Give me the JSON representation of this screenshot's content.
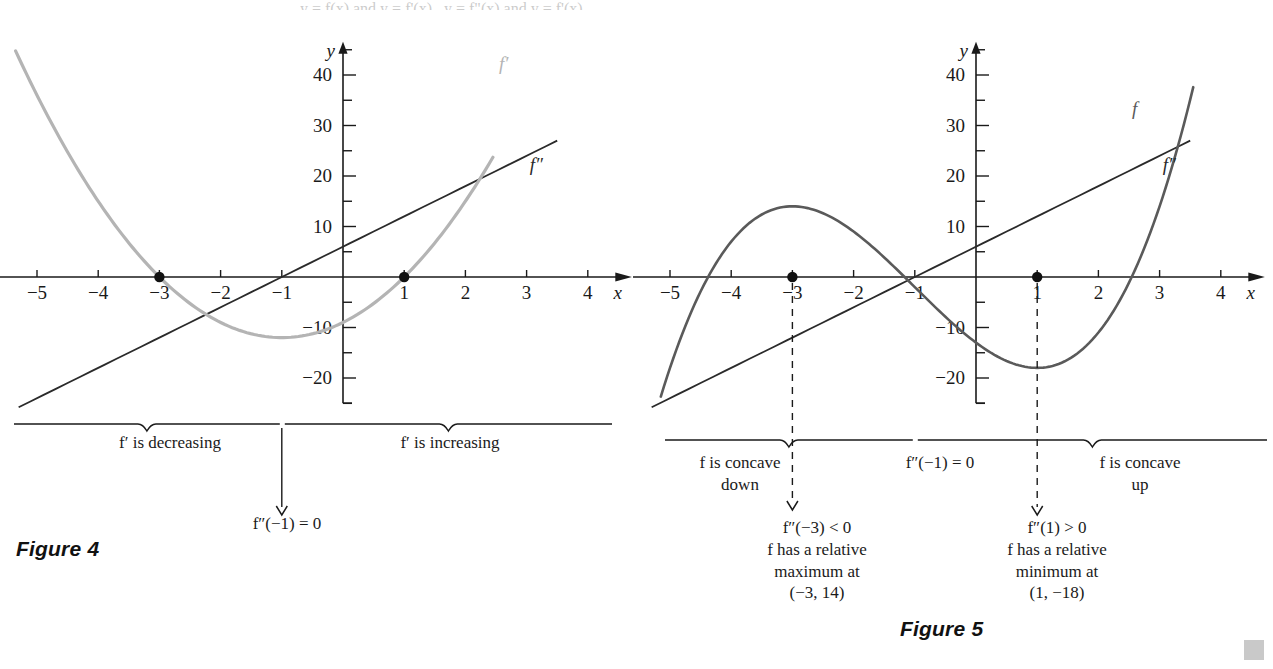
{
  "page": {
    "top_cut_text": "y = f(x)   and   y = f'(x)   ,   y = f\"(x)   and   y = f'(x)",
    "corner_mark": "gray-square"
  },
  "figures": [
    {
      "id": "figure-4",
      "caption": "Figure 4",
      "axis": {
        "x_label": "x",
        "y_label": "y",
        "x_ticks": [
          -5,
          -4,
          -3,
          -2,
          -1,
          1,
          2,
          3,
          4
        ],
        "x_tick_labels": [
          "−5",
          "−4",
          "−3",
          "−2",
          "−1",
          "1",
          "2",
          "3",
          "4"
        ],
        "y_tick_labels": [
          "40",
          "30",
          "20",
          "10",
          "−10",
          "−20"
        ],
        "y_ticks": [
          40,
          30,
          20,
          10,
          -10,
          -20
        ],
        "y_minor_step": 5,
        "xlim": [
          -5.6,
          4.6
        ],
        "ylim": [
          -25,
          46
        ]
      },
      "curves": [
        {
          "name": "f-prime-curve",
          "label": "f′",
          "color": "#b4b4b4",
          "label_x": 2.55,
          "label_y": 41
        },
        {
          "name": "f-double-prime-line",
          "label": "f″",
          "color": "#2a2a2a",
          "label_x": 3.05,
          "label_y": 21
        }
      ],
      "points": [
        {
          "name": "root-point-left",
          "x": -3,
          "y": 0
        },
        {
          "name": "root-point-right",
          "x": 1,
          "y": 0
        }
      ],
      "braces": [
        {
          "name": "brace-decreasing",
          "label": "f′ is decreasing"
        },
        {
          "name": "brace-increasing",
          "label": "f′ is increasing"
        }
      ],
      "callout": {
        "name": "inflection-callout",
        "text": "f″(−1) = 0"
      }
    },
    {
      "id": "figure-5",
      "caption": "Figure 5",
      "axis": {
        "x_label": "x",
        "y_label": "y",
        "x_ticks": [
          -5,
          -4,
          -3,
          -2,
          -1,
          1,
          2,
          3,
          4
        ],
        "x_tick_labels": [
          "−5",
          "−4",
          "−3",
          "−2",
          "−1",
          "1",
          "2",
          "3",
          "4"
        ],
        "y_tick_labels": [
          "40",
          "30",
          "20",
          "10",
          "−10",
          "−20"
        ],
        "y_ticks": [
          40,
          30,
          20,
          10,
          -10,
          -20
        ],
        "y_minor_step": 5,
        "xlim": [
          -5.6,
          4.6
        ],
        "ylim": [
          -25,
          46
        ]
      },
      "curves": [
        {
          "name": "f-curve",
          "label": "f",
          "color": "#5a5a5a",
          "label_x": 2.55,
          "label_y": 32
        },
        {
          "name": "f-double-prime-line",
          "label": "f″",
          "color": "#2a2a2a",
          "label_x": 3.05,
          "label_y": 21
        }
      ],
      "points": [
        {
          "name": "relative-max-marker",
          "x": -3,
          "y": 0
        },
        {
          "name": "relative-min-marker",
          "x": 1,
          "y": 0
        }
      ],
      "braces": [
        {
          "name": "brace-concave-down",
          "label": "f is concave\ndown"
        },
        {
          "name": "brace-concave-up",
          "label": "f is concave\nup"
        }
      ],
      "center_note": {
        "name": "inflection-note",
        "text": "f″(−1) = 0"
      },
      "callouts": [
        {
          "name": "callout-relative-maximum",
          "lines": [
            "f″(−3) < 0",
            "f has a relative",
            "maximum at",
            "(−3, 14)"
          ]
        },
        {
          "name": "callout-relative-minimum",
          "lines": [
            "f″(1) > 0",
            "f has a relative",
            "minimum at",
            "(1, −18)"
          ]
        }
      ]
    }
  ],
  "chart_data": [
    {
      "type": "line",
      "title": "Figure 4",
      "xlabel": "x",
      "ylabel": "y",
      "xlim": [
        -5.6,
        4.6
      ],
      "ylim": [
        -25,
        46
      ],
      "grid": false,
      "legend": "inline-labels",
      "series": [
        {
          "name": "f'",
          "expression": "3x^2 + 6x - 9",
          "color": "#b4b4b4",
          "domain": [
            -5.35,
            2.45
          ],
          "key_points": {
            "roots": [
              -3,
              1
            ],
            "vertex": [
              -1,
              -12
            ]
          },
          "x": [
            -5,
            -4,
            -3,
            -2,
            -1,
            0,
            1,
            2
          ],
          "y": [
            36,
            15,
            0,
            -9,
            -12,
            -9,
            0,
            15
          ]
        },
        {
          "name": "f\"",
          "expression": "6x + 6",
          "color": "#2a2a2a",
          "domain": [
            -5.3,
            3.6
          ],
          "key_points": {
            "roots": [
              -1
            ]
          },
          "x": [
            -5,
            -4,
            -3,
            -2,
            -1,
            0,
            1,
            2,
            3
          ],
          "y": [
            -24,
            -18,
            -12,
            -6,
            0,
            6,
            12,
            18,
            24
          ]
        }
      ],
      "annotations": [
        "f' is decreasing",
        "f' is increasing",
        "f\"(-1) = 0"
      ]
    },
    {
      "type": "line",
      "title": "Figure 5",
      "xlabel": "x",
      "ylabel": "y",
      "xlim": [
        -5.6,
        4.6
      ],
      "ylim": [
        -25,
        46
      ],
      "grid": false,
      "legend": "inline-labels",
      "series": [
        {
          "name": "f",
          "expression": "x^3 + 3x^2 - 9x - 13",
          "color": "#5a5a5a",
          "domain": [
            -5.15,
            3.55
          ],
          "key_points": {
            "relative_maximum": [
              -3,
              14
            ],
            "relative_minimum": [
              1,
              -18
            ],
            "inflection": [
              -1,
              -2
            ]
          },
          "x": [
            -5,
            -4,
            -3,
            -2,
            -1,
            0,
            1,
            2,
            3
          ],
          "y": [
            -18,
            7,
            14,
            9,
            -2,
            -13,
            -18,
            -11,
            14
          ]
        },
        {
          "name": "f\"",
          "expression": "6x + 6",
          "color": "#2a2a2a",
          "domain": [
            -5.3,
            3.6
          ],
          "key_points": {
            "roots": [
              -1
            ]
          },
          "x": [
            -5,
            -4,
            -3,
            -2,
            -1,
            0,
            1,
            2,
            3
          ],
          "y": [
            -24,
            -18,
            -12,
            -6,
            0,
            6,
            12,
            18,
            24
          ]
        }
      ],
      "annotations": [
        "f is concave down",
        "f\"(-1) = 0",
        "f is concave up",
        "f\"(-3) < 0",
        "f has a relative maximum at (-3, 14)",
        "f\"(1) > 0",
        "f has a relative minimum at (1, -18)"
      ]
    }
  ]
}
